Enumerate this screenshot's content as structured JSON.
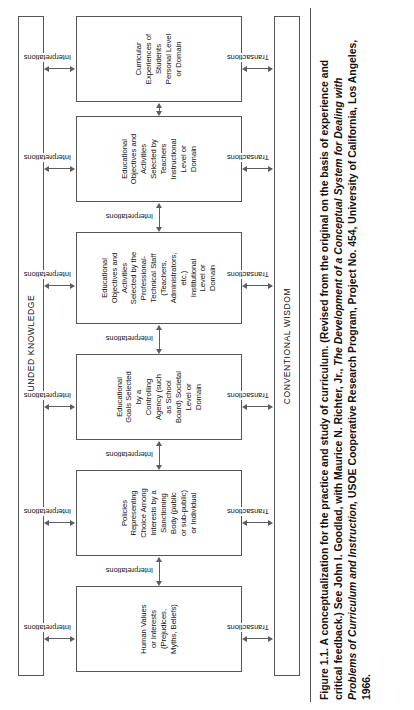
{
  "figure": {
    "rails": {
      "top": {
        "label": "FUNDED KNOWLEDGE",
        "name": "funded-knowledge-rail"
      },
      "bottom": {
        "label": "CONVENTIONAL WISDOM",
        "name": "conventional-wisdom-rail"
      }
    },
    "boxes": [
      {
        "id": "human-values",
        "text": "Human Values\nor Interests\n(Prejudices,\nMyths, Beliefs)"
      },
      {
        "id": "policies",
        "text": "Policies\nRepresenting\nChoice Among\nInterests by a\nSanctioning\nBody (public\nor sub-public)\nor Individual"
      },
      {
        "id": "educational-goals",
        "text": "Educational\nGoals Selected\nby a\nControlling\nAgency (such\nas School\nBoard) Societal\nLevel or\nDomain"
      },
      {
        "id": "objectives-professional-staff",
        "text": "Educational\nObjectives and\nActivities\nSelected by the\nProfessional-\nTechnical Staff\n(Teachers,\nAdministrators,\netc.)\nInstitutional\nLevel or\nDomain"
      },
      {
        "id": "objectives-teachers",
        "text": "Educational\nObjectives and\nActivities\nSelected by\nTeachers\nInstructional\nLevel or\nDomain"
      },
      {
        "id": "curricular-experiences",
        "text": "Curricular\nExperiences of\nStudents\nPersonal Level\nor Domain"
      }
    ],
    "edge_labels": {
      "interpretations": "Interpretations",
      "transactions": "Transactions"
    }
  },
  "caption": {
    "line1": "Figure 1.1. A conceptualization for the practice and study of curriculum. (Revised from the original on the basis of experience and",
    "line2": "critical feedback.) See John I. Goodlad, with Maurice N. Richter, Jr., ",
    "line2_italic": "The Development of a Conceptual System for Dealing with",
    "line3_italic": "Problems of Curriculum and Instruction,",
    "line3": " USOE Cooperative Research Program, Project No. 454, University of California, Los Angeles,",
    "line4": "1966."
  },
  "colors": {
    "stroke": "#55565a",
    "text": "#111111",
    "background": "#ffffff"
  }
}
